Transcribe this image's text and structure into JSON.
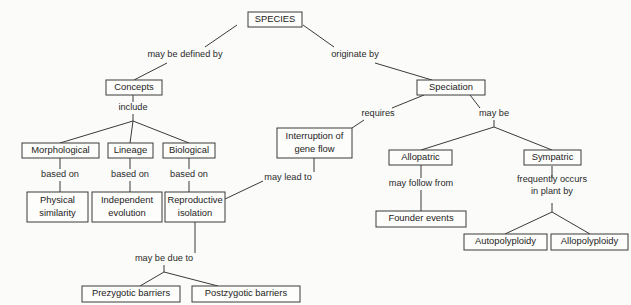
{
  "diagram": {
    "type": "concept-map",
    "background_color": "#fbfbf9",
    "line_color": "#3a3a3a",
    "text_color": "#1c1c1c",
    "nodes": [
      {
        "id": "species",
        "label": "SPECIES",
        "x": 248,
        "y": 12,
        "w": 54,
        "h": 15,
        "lines": [
          "SPECIES"
        ]
      },
      {
        "id": "concepts",
        "label": "Concepts",
        "x": 106,
        "y": 80,
        "w": 56,
        "h": 15,
        "lines": [
          "Concepts"
        ]
      },
      {
        "id": "speciation",
        "label": "Speciation",
        "x": 417,
        "y": 80,
        "w": 68,
        "h": 15,
        "lines": [
          "Speciation"
        ]
      },
      {
        "id": "morphological",
        "label": "Morphological",
        "x": 22,
        "y": 143,
        "w": 77,
        "h": 15,
        "lines": [
          "Morphological"
        ]
      },
      {
        "id": "lineage",
        "label": "Lineage",
        "x": 108,
        "y": 143,
        "w": 45,
        "h": 15,
        "lines": [
          "Lineage"
        ]
      },
      {
        "id": "biological",
        "label": "Biological",
        "x": 163,
        "y": 143,
        "w": 52,
        "h": 15,
        "lines": [
          "Biological"
        ]
      },
      {
        "id": "interruption",
        "label": "Interruption of gene flow",
        "x": 277,
        "y": 128,
        "w": 75,
        "h": 30,
        "lines": [
          "Interruption of",
          "gene flow"
        ]
      },
      {
        "id": "physical_similarity",
        "label": "Physical similarity",
        "x": 27,
        "y": 192,
        "w": 61,
        "h": 30,
        "lines": [
          "Physical",
          "similarity"
        ]
      },
      {
        "id": "independent_evol",
        "label": "Independent evolution",
        "x": 92,
        "y": 192,
        "w": 70,
        "h": 30,
        "lines": [
          "Independent",
          "evolution"
        ]
      },
      {
        "id": "reproductive_isol",
        "label": "Reproductive isolation",
        "x": 165,
        "y": 192,
        "w": 60,
        "h": 30,
        "lines": [
          "Reproductive",
          "isolation"
        ]
      },
      {
        "id": "allopatric",
        "label": "Allopatric",
        "x": 389,
        "y": 150,
        "w": 63,
        "h": 15,
        "lines": [
          "Allopatric"
        ]
      },
      {
        "id": "sympatric",
        "label": "Sympatric",
        "x": 524,
        "y": 150,
        "w": 57,
        "h": 15,
        "lines": [
          "Sympatric"
        ]
      },
      {
        "id": "founder_events",
        "label": "Founder events",
        "x": 376,
        "y": 211,
        "w": 90,
        "h": 16,
        "lines": [
          "Founder events"
        ]
      },
      {
        "id": "autopolyploidy",
        "label": "Autopolyploidy",
        "x": 464,
        "y": 234,
        "w": 83,
        "h": 16,
        "lines": [
          "Autopolyploidy"
        ]
      },
      {
        "id": "allopolyploidy",
        "label": "Allopolyploidy",
        "x": 551,
        "y": 234,
        "w": 77,
        "h": 16,
        "lines": [
          "Allopolyploidy"
        ]
      },
      {
        "id": "prezygotic",
        "label": "Prezygotic barriers",
        "x": 82,
        "y": 286,
        "w": 98,
        "h": 16,
        "lines": [
          "Prezygotic barriers"
        ]
      },
      {
        "id": "postzygotic",
        "label": "Postzygotic barriers",
        "x": 192,
        "y": 286,
        "w": 108,
        "h": 16,
        "lines": [
          "Postzygotic barriers"
        ]
      }
    ],
    "link_labels": [
      {
        "id": "may_be_defined_by",
        "text": "may be defined by",
        "x": 185,
        "y": 55,
        "lines": [
          "may be defined by"
        ]
      },
      {
        "id": "originate_by",
        "text": "originate by",
        "x": 355,
        "y": 55,
        "lines": [
          "originate by"
        ]
      },
      {
        "id": "include",
        "text": "include",
        "x": 133,
        "y": 108,
        "lines": [
          "include"
        ]
      },
      {
        "id": "requires",
        "text": "requires",
        "x": 378,
        "y": 114,
        "lines": [
          "requires"
        ]
      },
      {
        "id": "may_be",
        "text": "may be",
        "x": 494,
        "y": 114,
        "lines": [
          "may be"
        ]
      },
      {
        "id": "based_on_1",
        "text": "based on",
        "x": 60,
        "y": 175,
        "lines": [
          "based on"
        ]
      },
      {
        "id": "based_on_2",
        "text": "based on",
        "x": 130,
        "y": 175,
        "lines": [
          "based on"
        ]
      },
      {
        "id": "based_on_3",
        "text": "based on",
        "x": 189,
        "y": 175,
        "lines": [
          "based on"
        ]
      },
      {
        "id": "may_lead_to",
        "text": "may lead to",
        "x": 288,
        "y": 178,
        "lines": [
          "may lead to"
        ]
      },
      {
        "id": "may_follow_from",
        "text": "may follow from",
        "x": 421,
        "y": 184,
        "lines": [
          "may follow from"
        ]
      },
      {
        "id": "frequently_occurs",
        "text": "frequently occurs in plant by",
        "x": 552,
        "y": 186,
        "lines": [
          "frequently occurs",
          "in plant by"
        ]
      },
      {
        "id": "may_be_due_to",
        "text": "may be due to",
        "x": 164,
        "y": 259,
        "lines": [
          "may be due to"
        ]
      }
    ],
    "edges": [
      {
        "id": "species-to-may-be-defined-by",
        "from": "species",
        "to": "may_be_defined_by",
        "points": "237,25 205,47"
      },
      {
        "id": "may-be-defined-by-to-concepts",
        "from": "may_be_defined_by",
        "to": "concepts",
        "points": "167,63 134,80"
      },
      {
        "id": "species-to-originate-by",
        "from": "species",
        "to": "originate_by",
        "points": "303,25 334,47"
      },
      {
        "id": "originate-by-to-speciation",
        "from": "originate_by",
        "to": "speciation",
        "points": "375,63 432,80"
      },
      {
        "id": "concepts-to-include",
        "from": "concepts",
        "to": "include",
        "points": "133,95 133,102"
      },
      {
        "id": "include-to-junction",
        "from": "include",
        "to": "fanout",
        "points": "133,114 133,121"
      },
      {
        "id": "junction-to-morphological",
        "from": "fanout",
        "to": "morphological",
        "points": "133,121 60,143"
      },
      {
        "id": "junction-to-lineage",
        "from": "fanout",
        "to": "lineage",
        "points": "133,121 130,143"
      },
      {
        "id": "junction-to-biological",
        "from": "fanout",
        "to": "biological",
        "points": "133,121 189,143"
      },
      {
        "id": "morphological-to-based-on-1",
        "from": "morphological",
        "to": "based_on_1",
        "points": "60,158 60,169"
      },
      {
        "id": "based-on-1-to-physical",
        "from": "based_on_1",
        "to": "physical_similarity",
        "points": "60,181 60,192"
      },
      {
        "id": "lineage-to-based-on-2",
        "from": "lineage",
        "to": "based_on_2",
        "points": "130,158 130,169"
      },
      {
        "id": "based-on-2-to-independent",
        "from": "based_on_2",
        "to": "independent_evol",
        "points": "130,181 130,192"
      },
      {
        "id": "biological-to-based-on-3",
        "from": "biological",
        "to": "based_on_3",
        "points": "189,158 189,169"
      },
      {
        "id": "based-on-3-to-reproductive",
        "from": "based_on_3",
        "to": "reproductive_isol",
        "points": "189,181 189,192"
      },
      {
        "id": "speciation-to-requires",
        "from": "speciation",
        "to": "requires",
        "points": "424,95 392,108"
      },
      {
        "id": "requires-to-interruption",
        "from": "requires",
        "to": "interruption",
        "points": "364,120 352,128"
      },
      {
        "id": "interruption-to-may-lead-to",
        "from": "interruption",
        "to": "may_lead_to",
        "points": "314,158 314,172"
      },
      {
        "id": "may-lead-to-to-reproductive",
        "from": "may_lead_to",
        "to": "reproductive_isol",
        "points": "263,181 225,199"
      },
      {
        "id": "reproductive-to-may-be-due-to",
        "from": "reproductive_isol",
        "to": "may_be_due_to",
        "points": "195,222 195,253"
      },
      {
        "id": "may-be-due-to-junction",
        "from": "may_be_due_to",
        "to": "fanout2",
        "points": "164,265 164,272"
      },
      {
        "id": "junction2-to-prezygotic",
        "from": "fanout2",
        "to": "prezygotic",
        "points": "164,272 140,286"
      },
      {
        "id": "junction2-to-postzygotic",
        "from": "fanout2",
        "to": "postzygotic",
        "points": "164,272 218,286"
      },
      {
        "id": "speciation-to-may-be",
        "from": "speciation",
        "to": "may_be",
        "points": "470,95 480,108"
      },
      {
        "id": "may-be-to-junction3",
        "from": "may_be",
        "to": "fanout3",
        "points": "494,120 494,127"
      },
      {
        "id": "junction3-to-allopatric",
        "from": "fanout3",
        "to": "allopatric",
        "points": "494,127 421,150"
      },
      {
        "id": "junction3-to-sympatric",
        "from": "fanout3",
        "to": "sympatric",
        "points": "494,127 552,150"
      },
      {
        "id": "allopatric-to-may-follow-from",
        "from": "allopatric",
        "to": "may_follow_from",
        "points": "421,165 421,178"
      },
      {
        "id": "may-follow-from-to-founder",
        "from": "may_follow_from",
        "to": "founder_events",
        "points": "421,190 421,211"
      },
      {
        "id": "sympatric-to-frequently",
        "from": "sympatric",
        "to": "frequently_occurs",
        "points": "552,166 552,178"
      },
      {
        "id": "frequently-to-junction4",
        "from": "frequently_occurs",
        "to": "fanout4",
        "points": "552,203 552,212"
      },
      {
        "id": "junction4-to-autopolyploidy",
        "from": "fanout4",
        "to": "autopolyploidy",
        "points": "552,212 505,234"
      },
      {
        "id": "junction4-to-allopolyploidy",
        "from": "fanout4",
        "to": "allopolyploidy",
        "points": "552,212 590,234"
      }
    ]
  }
}
